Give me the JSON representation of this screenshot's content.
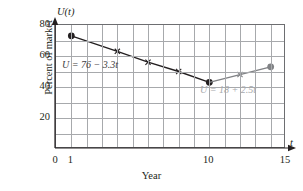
{
  "chart_data": {
    "type": "line",
    "title": "",
    "xlabel": "Year",
    "ylabel": "Percent of market",
    "xlim": [
      0,
      15
    ],
    "ylim": [
      0,
      80
    ],
    "grid": true,
    "legend": false,
    "axis_symbols": {
      "x": "t",
      "y": "U(t)"
    },
    "xticks": [
      0,
      1,
      10,
      15
    ],
    "xtick_labels": [
      "0",
      "1",
      "10",
      "15"
    ],
    "yticks": [
      20,
      40,
      60,
      80
    ],
    "ytick_labels": [
      "20",
      "40",
      "60",
      "80"
    ],
    "gridlines": {
      "x_step": 1,
      "y_values": [
        10,
        20,
        30,
        40,
        50,
        60,
        70
      ]
    },
    "series": [
      {
        "name": "decline",
        "equation": "U = 76 - 3.3t",
        "color": "#231f20",
        "x": [
          1,
          4,
          6,
          8,
          10
        ],
        "values": [
          73,
          63,
          56,
          50,
          43
        ],
        "endpoint_marker": "filled-circle",
        "mid_marker": "cross"
      },
      {
        "name": "recovery",
        "equation": "U = 18 + 2.5t",
        "color": "#808285",
        "x": [
          10,
          12,
          14
        ],
        "values": [
          43,
          48,
          53
        ],
        "endpoint_marker": "filled-circle",
        "mid_marker": "cross"
      }
    ],
    "annotations": [
      {
        "text": "U = 76 − 3.3t",
        "x": 2.2,
        "y": 57,
        "color": "#414042"
      },
      {
        "text": "U = 18 + 2.5t",
        "x": 9.8,
        "y": 39,
        "color": "#a7a9ac"
      }
    ]
  }
}
